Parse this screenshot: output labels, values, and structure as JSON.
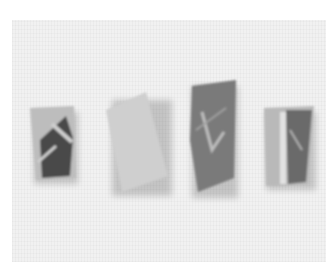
{
  "scene": {
    "description": "Photograph of four mineral/rock specimens on a light gray textured background",
    "background_color": "#f1f1f1",
    "specimens": [
      {
        "name": "specimen-1",
        "color": "#bdbdbd",
        "vein_color": "#4a4a4a"
      },
      {
        "name": "specimen-2",
        "color": "#cfcfcf"
      },
      {
        "name": "specimen-3",
        "color": "#7a7a7a"
      },
      {
        "name": "specimen-4",
        "color": "#b9b9b9",
        "dark_color": "#6a6a6a"
      }
    ]
  }
}
